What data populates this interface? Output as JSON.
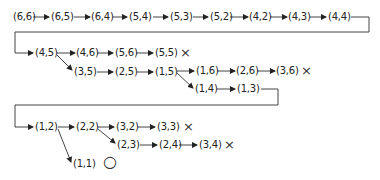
{
  "diagram": {
    "type": "search-tree",
    "rows": [
      {
        "id": "row1",
        "nodes": [
          "(6,6)",
          "(6,5)",
          "(6,4)",
          "(5,4)",
          "(5,3)",
          "(5,2)",
          "(4,2)",
          "(4,3)",
          "(4,4)"
        ]
      },
      {
        "id": "row2",
        "nodes": [
          "(4,5)",
          "(4,6)",
          "(5,6)",
          "(5,5)"
        ],
        "end_mark": "cross"
      },
      {
        "id": "row3",
        "nodes": [
          "(3,5)",
          "(2,5)",
          "(1,5)",
          "(1,6)",
          "(2,6)",
          "(3,6)"
        ],
        "end_mark": "cross"
      },
      {
        "id": "row4",
        "nodes": [
          "(1,4)",
          "(1,3)"
        ]
      },
      {
        "id": "row5",
        "nodes": [
          "(1,2)",
          "(2,2)",
          "(3,2)",
          "(3,3)"
        ],
        "end_mark": "cross"
      },
      {
        "id": "row6",
        "nodes": [
          "(2,3)",
          "(2,4)",
          "(3,4)"
        ],
        "end_mark": "cross"
      },
      {
        "id": "row7",
        "nodes": [
          "(1,1)"
        ],
        "end_mark": "circle"
      }
    ],
    "labels": {
      "n66": "(6,6)",
      "n65": "(6,5)",
      "n64": "(6,4)",
      "n54": "(5,4)",
      "n53": "(5,3)",
      "n52": "(5,2)",
      "n42": "(4,2)",
      "n43": "(4,3)",
      "n44": "(4,4)",
      "n45": "(4,5)",
      "n46": "(4,6)",
      "n56": "(5,6)",
      "n55": "(5,5)",
      "n35": "(3,5)",
      "n25": "(2,5)",
      "n15": "(1,5)",
      "n16": "(1,6)",
      "n26": "(2,6)",
      "n36": "(3,6)",
      "n14": "(1,4)",
      "n13": "(1,3)",
      "n12": "(1,2)",
      "n22": "(2,2)",
      "n32": "(3,2)",
      "n33": "(3,3)",
      "n23": "(2,3)",
      "n24": "(2,4)",
      "n34": "(3,4)",
      "n11": "(1,1)"
    },
    "marks": {
      "cross": "×",
      "circle": "○"
    },
    "colors": {
      "line": "#444444",
      "text": "#222222"
    }
  }
}
